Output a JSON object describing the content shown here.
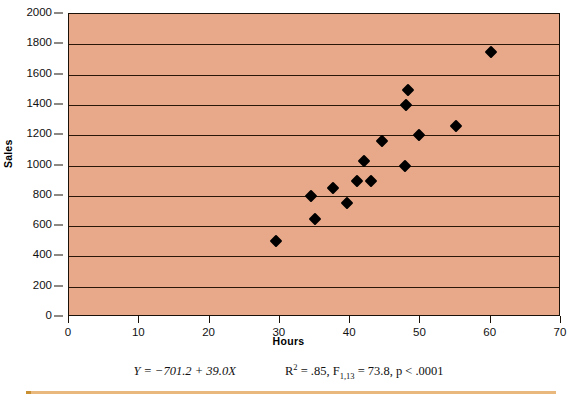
{
  "chart_data": {
    "type": "scatter",
    "title": "",
    "xlabel": "Hours",
    "ylabel": "Sales",
    "xlim": [
      0,
      70
    ],
    "ylim": [
      0,
      2000
    ],
    "x_ticks": [
      0,
      10,
      20,
      30,
      40,
      50,
      60,
      70
    ],
    "y_ticks": [
      0,
      200,
      400,
      600,
      800,
      1000,
      1200,
      1400,
      1600,
      1800,
      2000
    ],
    "grid": "horizontal",
    "legend": "none",
    "marker": "diamond",
    "marker_color": "#000000",
    "plot_background_color": "#e8a98a",
    "points": [
      {
        "x": 29.5,
        "y": 500
      },
      {
        "x": 34.5,
        "y": 800
      },
      {
        "x": 35.0,
        "y": 650
      },
      {
        "x": 37.5,
        "y": 850
      },
      {
        "x": 39.5,
        "y": 750
      },
      {
        "x": 41.0,
        "y": 900
      },
      {
        "x": 43.0,
        "y": 900
      },
      {
        "x": 44.5,
        "y": 1160
      },
      {
        "x": 47.8,
        "y": 1000
      },
      {
        "x": 48.0,
        "y": 1400
      },
      {
        "x": 48.3,
        "y": 1500
      },
      {
        "x": 49.8,
        "y": 1200
      },
      {
        "x": 55.0,
        "y": 1260
      },
      {
        "x": 60.0,
        "y": 1750
      },
      {
        "x": 42.0,
        "y": 1030
      }
    ],
    "annotations": {
      "equation": "Y = −701.2 + 39.0X",
      "r_squared_label": "R",
      "r_squared_exp": "2",
      "r_squared_value": " = .85, ",
      "f_label": "F",
      "f_subscript": "1,13",
      "f_value": " = 73.8, p < .0001"
    }
  },
  "axes": {
    "y_title": "Sales",
    "x_title": "Hours"
  },
  "caption": {
    "equation": "Y = −701.2 + 39.0X",
    "stat_r": "R",
    "stat_r_sup": "2",
    "stat_r_rest": " = .85, ",
    "stat_f": "F",
    "stat_f_sub": "1,13",
    "stat_f_rest": " = 73.8, p < .0001"
  },
  "colors": {
    "plot_background": "#e8a98a",
    "gridline": "#2b1708",
    "marker": "#000000",
    "rule": "#e9b87c"
  }
}
